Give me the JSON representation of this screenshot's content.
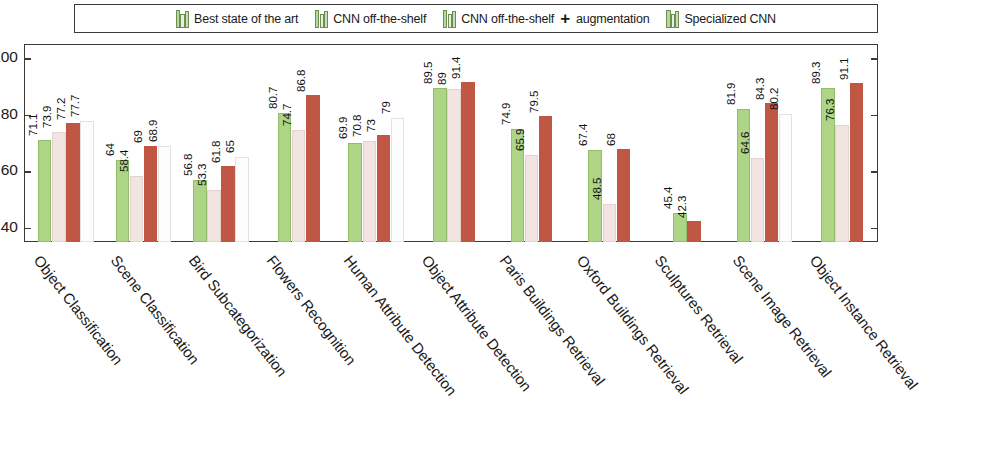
{
  "chart_data": {
    "type": "bar",
    "title": "",
    "xlabel": "",
    "ylabel": "",
    "ylim": [
      35,
      105
    ],
    "yticks": [
      40,
      60,
      80,
      100
    ],
    "grid": false,
    "legend_position": "top",
    "categories": [
      "Object Classification",
      "Scene Classification",
      "Bird Subcategorization",
      "Flowers Recognition",
      "Human Attribute Detection",
      "Object Attribute Detection",
      "Paris Buildings Retrieval",
      "Oxford Buildings Retrieval",
      "Sculptures Retrieval",
      "Scene Image Retrieval",
      "Object Instance Retrieval"
    ],
    "series": [
      {
        "name": "Best state of the art",
        "color": "#aed486",
        "values": [
          71.1,
          64,
          56.8,
          80.7,
          69.9,
          89.5,
          74.9,
          67.4,
          45.4,
          81.9,
          89.3
        ]
      },
      {
        "name": "CNN off-the-shelf",
        "color": "#f2e5e1",
        "values": [
          73.9,
          58.4,
          53.3,
          74.7,
          70.8,
          89,
          65.9,
          48.5,
          null,
          64.6,
          76.3
        ]
      },
      {
        "name": "CNN off-the-shelf + augmentation",
        "color": "#bf5744",
        "values": [
          77.2,
          69,
          61.8,
          86.8,
          73,
          91.4,
          79.5,
          68,
          42.3,
          84.3,
          91.1
        ]
      },
      {
        "name": "Specialized CNN",
        "color": "#fdfdfd",
        "values": [
          77.7,
          68.9,
          65,
          null,
          79,
          null,
          null,
          null,
          null,
          80.2,
          null
        ]
      }
    ]
  },
  "legend": {
    "entries": [
      {
        "label": "Best state of the art",
        "plus": false
      },
      {
        "label": "CNN off-the-shelf",
        "plus": false
      },
      {
        "label": "CNN off-the-shelf",
        "plus": true,
        "plus_suffix": "augmentation"
      },
      {
        "label": "Specialized CNN",
        "plus": false
      }
    ],
    "plus_symbol": "+"
  },
  "axis": {
    "ytick_labels": [
      "100",
      "80",
      "60",
      "40"
    ]
  }
}
